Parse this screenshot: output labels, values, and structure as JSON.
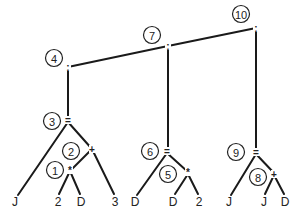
{
  "diagram": {
    "type": "parse-tree",
    "nodes": [
      {
        "id": 10,
        "label": "10",
        "op": ";",
        "x": 256,
        "y": 28,
        "cx": 241,
        "cy": 14
      },
      {
        "id": 7,
        "label": "7",
        "op": ";",
        "x": 168,
        "y": 46,
        "cx": 152,
        "cy": 35
      },
      {
        "id": 4,
        "label": "4",
        "op": ";",
        "x": 68,
        "y": 67,
        "cx": 54,
        "cy": 58
      },
      {
        "id": 3,
        "label": "3",
        "op": "=",
        "x": 68,
        "y": 120,
        "cx": 52,
        "cy": 121
      },
      {
        "id": 2,
        "label": "2",
        "op": "+",
        "x": 92,
        "y": 149,
        "cx": 71,
        "cy": 151
      },
      {
        "id": 1,
        "label": "1",
        "op": "*",
        "x": 70,
        "y": 170,
        "cx": 55,
        "cy": 170
      },
      {
        "id": 6,
        "label": "6",
        "op": "=",
        "x": 167,
        "y": 151,
        "cx": 150,
        "cy": 151
      },
      {
        "id": 5,
        "label": "5",
        "op": "*",
        "x": 188,
        "y": 172,
        "cx": 168,
        "cy": 174
      },
      {
        "id": 9,
        "label": "9",
        "op": "=",
        "x": 256,
        "y": 152,
        "cx": 236,
        "cy": 152
      },
      {
        "id": 8,
        "label": "8",
        "op": "+",
        "x": 274,
        "y": 174,
        "cx": 258,
        "cy": 177
      }
    ],
    "leaves": [
      {
        "label": "J",
        "x": 15,
        "y": 202
      },
      {
        "label": "2",
        "x": 58,
        "y": 202
      },
      {
        "label": "D",
        "x": 81,
        "y": 202
      },
      {
        "label": "3",
        "x": 115,
        "y": 202
      },
      {
        "label": "D",
        "x": 135,
        "y": 202
      },
      {
        "label": "D",
        "x": 173,
        "y": 202
      },
      {
        "label": "2",
        "x": 199,
        "y": 202
      },
      {
        "label": "J",
        "x": 229,
        "y": 202
      },
      {
        "label": "J",
        "x": 264,
        "y": 202
      },
      {
        "label": "D",
        "x": 285,
        "y": 202
      }
    ],
    "edges": [
      [
        256,
        28,
        168,
        46
      ],
      [
        168,
        46,
        68,
        67
      ],
      [
        256,
        28,
        256,
        150
      ],
      [
        168,
        46,
        168,
        149
      ],
      [
        68,
        67,
        68,
        118
      ],
      [
        68,
        122,
        18,
        195
      ],
      [
        68,
        122,
        92,
        149
      ],
      [
        92,
        149,
        72,
        169
      ],
      [
        92,
        149,
        114,
        194
      ],
      [
        70,
        171,
        59,
        194
      ],
      [
        70,
        171,
        80,
        194
      ],
      [
        167,
        153,
        137,
        195
      ],
      [
        167,
        153,
        188,
        172
      ],
      [
        188,
        174,
        175,
        194
      ],
      [
        188,
        174,
        198,
        194
      ],
      [
        256,
        154,
        231,
        195
      ],
      [
        256,
        154,
        274,
        173
      ],
      [
        274,
        175,
        265,
        194
      ],
      [
        274,
        175,
        284,
        194
      ]
    ],
    "statements": [
      "J = 2 * D + 3",
      "D = D * 2",
      "J = J + D"
    ]
  }
}
